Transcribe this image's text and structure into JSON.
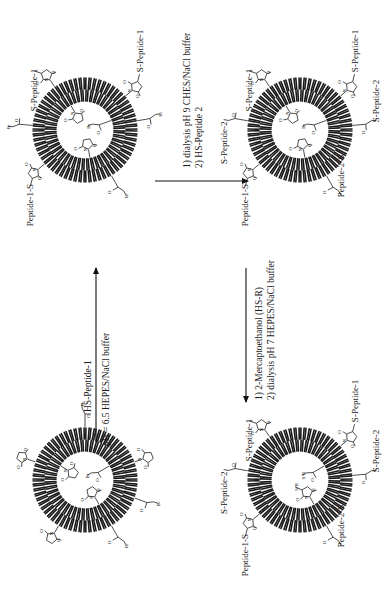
{
  "scheme": {
    "orientation": "rotated-90-ccw",
    "liposomes": [
      {
        "id": "A",
        "role": "starting-liposome",
        "center": [
          85,
          480
        ],
        "groups": [
          {
            "type": "maleimide",
            "angle": 200,
            "side": "outer"
          },
          {
            "type": "maleimide",
            "angle": 120,
            "side": "outer"
          },
          {
            "type": "bromoacetyl",
            "angle": 270,
            "side": "outer"
          },
          {
            "type": "maleimide",
            "angle": 340,
            "side": "outer"
          },
          {
            "type": "bromoacetyl",
            "angle": 20,
            "side": "outer"
          },
          {
            "type": "bromoacetyl",
            "angle": 60,
            "side": "outer"
          },
          {
            "type": "maleimide",
            "angle": 210,
            "side": "inner"
          },
          {
            "type": "maleimide",
            "angle": 60,
            "side": "inner"
          },
          {
            "type": "bromoacetyl",
            "angle": 330,
            "side": "inner"
          }
        ]
      },
      {
        "id": "B",
        "role": "after-peptide-1",
        "center": [
          85,
          130
        ],
        "labels": [
          "S-Peptide-1",
          "S-Peptide-1",
          "Peptide-1-S"
        ],
        "groups": [
          {
            "type": "succinimide-peptide1",
            "angle": 235,
            "side": "outer",
            "label": "S-Peptide-1"
          },
          {
            "type": "succinimide-peptide1",
            "angle": 320,
            "side": "outer",
            "label": "S-Peptide-1"
          },
          {
            "type": "succinimide-peptide1",
            "angle": 140,
            "side": "outer",
            "label": "Peptide-1-S"
          },
          {
            "type": "bromoacetyl",
            "angle": 185,
            "side": "outer"
          },
          {
            "type": "bromoacetyl",
            "angle": 350,
            "side": "outer"
          },
          {
            "type": "bromoacetyl",
            "angle": 60,
            "side": "outer"
          },
          {
            "type": "maleimide",
            "angle": 240,
            "side": "inner"
          },
          {
            "type": "maleimide",
            "angle": 80,
            "side": "inner"
          },
          {
            "type": "bromoacetyl",
            "angle": 340,
            "side": "inner"
          }
        ]
      },
      {
        "id": "C",
        "role": "after-peptide-2",
        "center": [
          300,
          130
        ],
        "labels": [
          "S-Peptide-1",
          "S-Peptide-1",
          "S-Peptide-2",
          "S-Peptide-2",
          "Peptide-1-S",
          "Peptide-2-S"
        ],
        "groups": [
          {
            "type": "succinimide-peptide1",
            "angle": 235,
            "side": "outer",
            "label": "S-Peptide-1"
          },
          {
            "type": "succinimide-peptide1",
            "angle": 320,
            "side": "outer",
            "label": "S-Peptide-1"
          },
          {
            "type": "succinimide-peptide1",
            "angle": 140,
            "side": "outer",
            "label": "Peptide-1-S"
          },
          {
            "type": "acetyl-peptide2",
            "angle": 190,
            "side": "outer",
            "label": "S-Peptide-2"
          },
          {
            "type": "acetyl-peptide2",
            "angle": 355,
            "side": "outer",
            "label": "S-Peptide-2"
          },
          {
            "type": "acetyl-peptide2",
            "angle": 60,
            "side": "outer",
            "label": "Peptide-2-S"
          },
          {
            "type": "maleimide",
            "angle": 240,
            "side": "inner"
          },
          {
            "type": "maleimide",
            "angle": 80,
            "side": "inner"
          },
          {
            "type": "bromoacetyl",
            "angle": 340,
            "side": "inner"
          }
        ]
      },
      {
        "id": "D",
        "role": "final-liposome",
        "center": [
          300,
          480
        ],
        "labels": [
          "S-Peptide-1",
          "S-Peptide-1",
          "S-Peptide-2",
          "S-Peptide-2",
          "Peptide-1-S",
          "Peptide-2-S",
          "S-R",
          "S-R"
        ],
        "groups": [
          {
            "type": "succinimide-peptide1",
            "angle": 235,
            "side": "outer",
            "label": "S-Peptide-1"
          },
          {
            "type": "succinimide-peptide1",
            "angle": 320,
            "side": "outer",
            "label": "S-Peptide-1"
          },
          {
            "type": "succinimide-peptide1",
            "angle": 140,
            "side": "outer",
            "label": "Peptide-1-S"
          },
          {
            "type": "acetyl-peptide2",
            "angle": 190,
            "side": "outer",
            "label": "S-Peptide-2"
          },
          {
            "type": "acetyl-peptide2",
            "angle": 355,
            "side": "outer",
            "label": "S-Peptide-2"
          },
          {
            "type": "acetyl-peptide2",
            "angle": 60,
            "side": "outer",
            "label": "Peptide-2-S"
          },
          {
            "type": "succinimide-SR",
            "angle": 60,
            "side": "inner",
            "label": "S-R"
          },
          {
            "type": "acetyl-SR",
            "angle": 330,
            "side": "inner",
            "label": "S-R"
          }
        ]
      }
    ],
    "arrows": [
      {
        "id": "step-1",
        "from": "A",
        "to": "B",
        "above": "HS-Peptide-1",
        "below": "pH = 6.5 HEPES/NaCl  buffer"
      },
      {
        "id": "step-2",
        "from": "B",
        "to": "C",
        "line1": "1) dialysis pH 9 CHES/NaCl  buffer",
        "line2": "2) HS-Peptide 2"
      },
      {
        "id": "step-3",
        "from": "C",
        "to": "D",
        "line1": "1) 2-Mercaptoethanol (HS-R)",
        "line2": "2) dialysis pH 7 HEPES/NaCl  buffer"
      }
    ],
    "atom_labels": {
      "bromine": "Br",
      "oxygen": "O",
      "nitrogen": "N"
    }
  }
}
